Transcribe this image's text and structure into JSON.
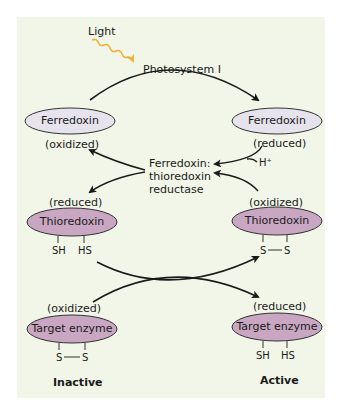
{
  "figure": {
    "light_label": "Light",
    "photosystem_label": "Photosystem I",
    "enzyme_label": [
      "Ferredoxin:",
      "thioredoxin",
      "reductase"
    ],
    "h_plus": "H⁺",
    "colors": {
      "panel_bg": "#f1f6e8",
      "ferredoxin_fill": "#e6e3ec",
      "protein_fill": "#c9a7c2",
      "light_arrow": "#f2b13c",
      "arrow": "#1a1a1a"
    },
    "left": {
      "ferredoxin": {
        "name": "Ferredoxin",
        "state": "(oxidized)"
      },
      "thioredoxin": {
        "name": "Thioredoxin",
        "state": "(reduced)",
        "groups": [
          "SH",
          "HS"
        ]
      },
      "target": {
        "name": "Target enzyme",
        "state": "(oxidized)",
        "groups": [
          "S",
          "S"
        ],
        "status": "Inactive"
      }
    },
    "right": {
      "ferredoxin": {
        "name": "Ferredoxin",
        "state": "(reduced)"
      },
      "thioredoxin": {
        "name": "Thioredoxin",
        "state": "(oxidized)",
        "groups": [
          "S",
          "S"
        ]
      },
      "target": {
        "name": "Target enzyme",
        "state": "(reduced)",
        "groups": [
          "SH",
          "HS"
        ],
        "status": "Active"
      }
    }
  }
}
